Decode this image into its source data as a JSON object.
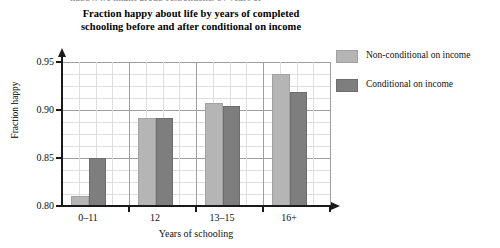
{
  "figure": {
    "cutoff_text_above": "happy, we might group respondents by years of",
    "title_line1": "Fraction happy about life by years of completed",
    "title_line2": "schooling before and after conditional on income"
  },
  "legend": {
    "position": "right",
    "items": [
      {
        "label": "Non-conditional on income",
        "color": "#b5b5b5",
        "swatch": "light-gray-swatch"
      },
      {
        "label": "Conditional on income",
        "color": "#7e7e7e",
        "swatch": "dark-gray-swatch"
      }
    ]
  },
  "chart_data": {
    "type": "bar",
    "title": "Fraction happy about life by years of completed schooling before and after conditional on income",
    "xlabel": "Years of schooling",
    "ylabel": "Fraction happy",
    "categories": [
      "0–11",
      "12",
      "13–15",
      "16+"
    ],
    "series": [
      {
        "name": "Non-conditional on income",
        "color": "#b5b5b5",
        "values": [
          0.81,
          0.892,
          0.907,
          0.938
        ]
      },
      {
        "name": "Conditional on income",
        "color": "#7e7e7e",
        "values": [
          0.85,
          0.892,
          0.904,
          0.919
        ]
      }
    ],
    "ylim": [
      0.8,
      0.95
    ],
    "yticks": [
      0.8,
      0.85,
      0.9,
      0.95
    ],
    "ytick_labels": [
      "0.80",
      "0.85",
      "0.90",
      "0.95"
    ],
    "grid": "both-minor-and-major",
    "legend_position": "right"
  }
}
